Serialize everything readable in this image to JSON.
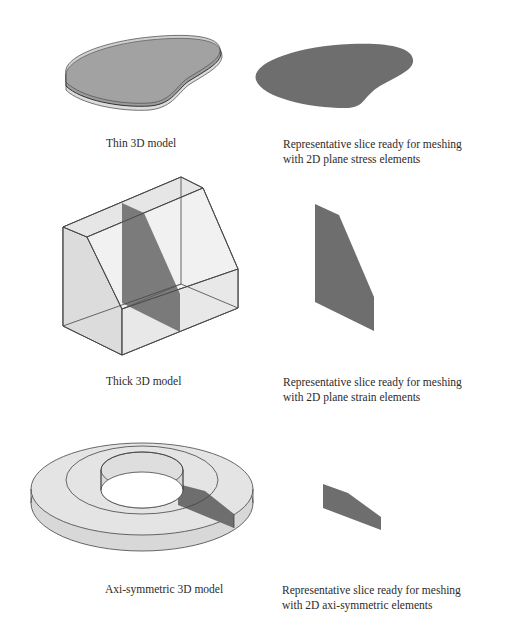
{
  "figure": {
    "rows": [
      {
        "id": "thin",
        "model_caption": "Thin 3D model",
        "slice_caption": [
          "Representative slice ready for meshing",
          "with 2D plane stress elements"
        ]
      },
      {
        "id": "thick",
        "model_caption": "Thick 3D model",
        "slice_caption": [
          "Representative slice ready for meshing",
          "with 2D plane strain elements"
        ]
      },
      {
        "id": "axisymmetric",
        "model_caption": "Axi-symmetric 3D model",
        "slice_caption": [
          "Representative slice ready for meshing",
          "with 2D axi-symmetric elements"
        ]
      }
    ],
    "colors": {
      "slice_fill": "#6e6e6e",
      "solid_light": "#e4e4e4",
      "solid_mid": "#d2d2d2",
      "edge": "#3a3a3a",
      "thin_mid_fill": "#9a9a9a"
    }
  }
}
